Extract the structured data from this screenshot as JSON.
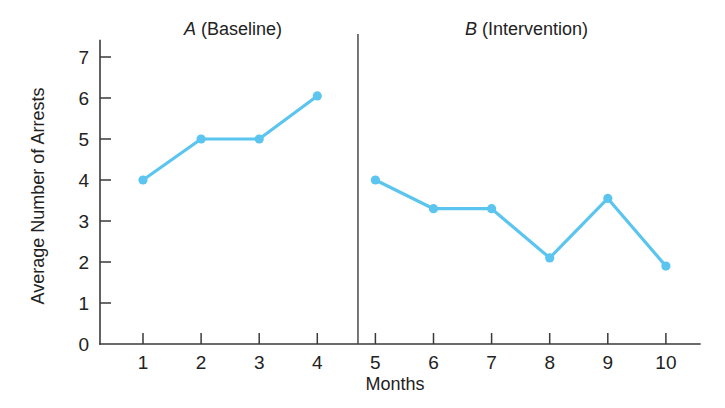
{
  "chart_data": {
    "type": "line",
    "title": "",
    "xlabel": "Months",
    "ylabel": "Average Number of Arrests",
    "xlim": [
      0,
      10.8
    ],
    "ylim": [
      0,
      7.4
    ],
    "grid": false,
    "legend": "none",
    "x_ticks": [
      1,
      2,
      3,
      4,
      5,
      6,
      7,
      8,
      9,
      10
    ],
    "x_tick_labels": [
      "1",
      "2",
      "3",
      "4",
      "5",
      "6",
      "7",
      "8",
      "9",
      "10"
    ],
    "y_ticks": [
      0,
      1,
      2,
      3,
      4,
      5,
      6,
      7
    ],
    "y_tick_labels": [
      "0",
      "1",
      "2",
      "3",
      "4",
      "5",
      "6",
      "7"
    ],
    "line_color": "#5BC5EF",
    "phase_divider_x": 4.7,
    "annotations": [
      {
        "name": "phase-a",
        "letter": "A",
        "text": " (Baseline)",
        "x": 2.55,
        "y_px": 35
      },
      {
        "name": "phase-b",
        "letter": "B",
        "text": " (Intervention)",
        "x": 7.6,
        "y_px": 35
      }
    ],
    "series": [
      {
        "name": "phase-a-baseline",
        "phase": "A (Baseline)",
        "x": [
          1,
          2,
          3,
          4
        ],
        "values": [
          4.0,
          5.0,
          5.0,
          6.05
        ]
      },
      {
        "name": "phase-b-intervention",
        "phase": "B (Intervention)",
        "x": [
          5,
          6,
          7,
          8,
          9,
          10
        ],
        "values": [
          4.0,
          3.3,
          3.3,
          2.1,
          3.55,
          1.9
        ]
      }
    ]
  },
  "figure": {
    "background": "#ffffff",
    "axis_color": "#3a3a3a"
  }
}
